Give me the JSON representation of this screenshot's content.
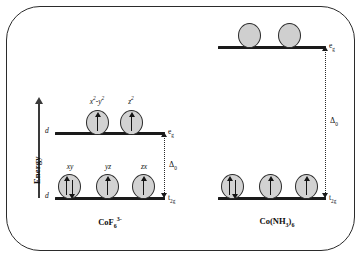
{
  "figure": {
    "energy_axis": {
      "label": "Energy",
      "direction": "up"
    },
    "colors": {
      "orbital_fill": "#d2d2d2",
      "outline": "#2a2a2a",
      "level_bar": "#1a1a1a",
      "frame": "#2b2b2b"
    }
  },
  "complexes": [
    {
      "id": "cof6",
      "formula_text": "CoF",
      "formula_sub": "6",
      "formula_sup": "3-",
      "spin_state": "high-spin",
      "splitting": {
        "label": "Δ",
        "sub": "0"
      },
      "levels": [
        {
          "name": "eg",
          "term_text": "e",
          "term_sub": "g",
          "d_label": "d",
          "orbitals": [
            {
              "label_html": "x<sup>2</sup>-y<sup>2</sup>",
              "label_plain": "x2-y2",
              "electrons": 1,
              "spins": [
                "up"
              ]
            },
            {
              "label_html": "z<sup>2</sup>",
              "label_plain": "z2",
              "electrons": 1,
              "spins": [
                "up"
              ]
            }
          ]
        },
        {
          "name": "t2g",
          "term_text": "t",
          "term_sub": "2g",
          "d_label": "d",
          "orbitals": [
            {
              "label_html": "xy",
              "label_plain": "xy",
              "electrons": 2,
              "spins": [
                "up",
                "down"
              ]
            },
            {
              "label_html": "yz",
              "label_plain": "yz",
              "electrons": 1,
              "spins": [
                "up"
              ]
            },
            {
              "label_html": "zx",
              "label_plain": "zx",
              "electrons": 1,
              "spins": [
                "up"
              ]
            }
          ]
        }
      ]
    },
    {
      "id": "conh3",
      "formula_text": "Co(NH",
      "formula_sub": "3",
      "formula_tail": ")",
      "formula_sub2": "6",
      "spin_state": "low-spin",
      "splitting": {
        "label": "Δ",
        "sub": "0"
      },
      "levels": [
        {
          "name": "eg",
          "term_text": "e",
          "term_sub": "g",
          "orbitals": [
            {
              "label_html": "",
              "label_plain": "",
              "electrons": 0,
              "spins": []
            },
            {
              "label_html": "",
              "label_plain": "",
              "electrons": 0,
              "spins": []
            }
          ]
        },
        {
          "name": "t2g",
          "term_text": "t",
          "term_sub": "2g",
          "orbitals": [
            {
              "label_html": "",
              "label_plain": "",
              "electrons": 2,
              "spins": [
                "up",
                "down"
              ]
            },
            {
              "label_html": "",
              "label_plain": "",
              "electrons": 1,
              "spins": [
                "up"
              ]
            },
            {
              "label_html": "",
              "label_plain": "",
              "electrons": 1,
              "spins": [
                "up"
              ]
            }
          ]
        }
      ]
    }
  ]
}
